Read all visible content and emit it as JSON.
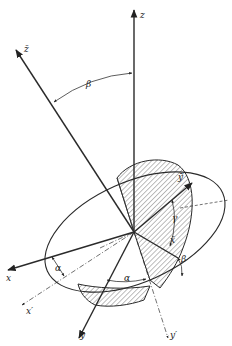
{
  "figure": {
    "type": "3D coordinate rotation diagram (Euler angles)",
    "axes": {
      "z": "z",
      "z_bar": "z̄",
      "x": "x",
      "x_prime": "x′",
      "y": "y",
      "y_prime": "y′",
      "x_bar": "x̄",
      "y_bar": "ȳ"
    },
    "angles": {
      "alpha_1": "α",
      "alpha_2": "α",
      "beta_top": "β",
      "beta_right": "β",
      "gamma": "γ"
    }
  }
}
